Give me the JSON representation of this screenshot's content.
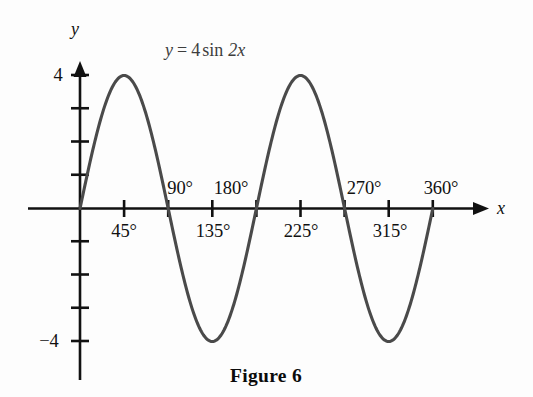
{
  "figure": {
    "caption": "Figure 6",
    "equation": {
      "lhs": "y",
      "equals": "=",
      "amplitude": "4",
      "function": "sin",
      "argument": "2x",
      "full": "y = 4 sin 2x"
    },
    "background_color": "#fdfdfd",
    "curve_color": "#4a4a4a",
    "axis_color": "#111111"
  },
  "axes": {
    "x_axis_name": "x",
    "y_axis_name": "y",
    "x_tick_labels_above": [
      "90°",
      "180°",
      "270°",
      "360°"
    ],
    "x_tick_labels_below": [
      "45°",
      "135°",
      "225°",
      "315°"
    ],
    "y_tick_labels": [
      "4",
      "−4"
    ],
    "y_max_label": "4",
    "y_min_label": "−4"
  },
  "chart_data": {
    "type": "line",
    "title": "",
    "subtitle": "",
    "annotations": [
      "y = 4 sin 2x",
      "Figure 6"
    ],
    "xlabel": "x",
    "ylabel": "y",
    "xlim": [
      0,
      405
    ],
    "ylim": [
      -4.8,
      4.8
    ],
    "x_unit": "degrees",
    "grid": false,
    "legend": null,
    "x_ticks": [
      0,
      45,
      90,
      135,
      180,
      225,
      270,
      315,
      360
    ],
    "x_tick_text": [
      "",
      "45°",
      "90°",
      "135°",
      "180°",
      "225°",
      "270°",
      "315°",
      "360°"
    ],
    "y_ticks": [
      -4,
      -3,
      -2,
      -1,
      0,
      1,
      2,
      3,
      4
    ],
    "y_tick_text": [
      "−4",
      "",
      "",
      "",
      "",
      "",
      "",
      "",
      "4"
    ],
    "series": [
      {
        "name": "y = 4 sin 2x",
        "equation": "y = 4*sin(2x)",
        "amplitude": 4,
        "period_degrees": 180,
        "color": "#4a4a4a",
        "x": [
          0,
          15,
          30,
          45,
          60,
          75,
          90,
          105,
          120,
          135,
          150,
          165,
          180,
          195,
          210,
          225,
          240,
          255,
          270,
          285,
          300,
          315,
          330,
          345,
          360
        ],
        "y": [
          0,
          2,
          3.46,
          4,
          3.46,
          2,
          0,
          -2,
          -3.46,
          -4,
          -3.46,
          -2,
          0,
          2,
          3.46,
          4,
          3.46,
          2,
          0,
          -2,
          -3.46,
          -4,
          -3.46,
          -2,
          0
        ]
      }
    ],
    "key_points": {
      "maxima_degrees": [
        45,
        225
      ],
      "minima_degrees": [
        135,
        315
      ],
      "zeros_degrees": [
        0,
        90,
        180,
        270,
        360
      ],
      "max_value": 4,
      "min_value": -4
    }
  }
}
